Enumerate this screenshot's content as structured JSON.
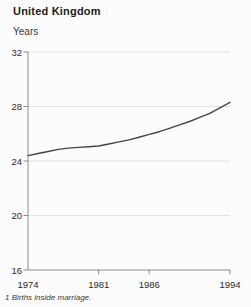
{
  "header": {
    "title": "United Kingdom",
    "ylabel": "Years"
  },
  "footnote": "1 Births inside marriage.",
  "chart_data": {
    "type": "line",
    "title": "United Kingdom",
    "xlabel": "",
    "ylabel": "Years",
    "xlim": [
      1974,
      1994
    ],
    "ylim": [
      16,
      32
    ],
    "grid": true,
    "legend": "none",
    "x": [
      1974,
      1975,
      1976,
      1977,
      1978,
      1979,
      1980,
      1981,
      1982,
      1983,
      1984,
      1985,
      1986,
      1987,
      1988,
      1989,
      1990,
      1991,
      1992,
      1993,
      1994
    ],
    "values": [
      24.4,
      24.55,
      24.7,
      24.85,
      24.95,
      25.0,
      25.05,
      25.1,
      25.25,
      25.4,
      25.55,
      25.75,
      25.95,
      26.15,
      26.4,
      26.65,
      26.9,
      27.2,
      27.5,
      27.9,
      28.3
    ],
    "xtick_labels": [
      "1974",
      "1981",
      "1986",
      "1994"
    ],
    "xtick_label_positions": [
      1974,
      1981,
      1986,
      1994
    ],
    "xtick_marks": [
      1981,
      1986,
      1994
    ],
    "yticks": [
      16,
      20,
      24,
      28,
      32
    ],
    "footnote": "1 Births inside marriage.",
    "colors": {
      "line": "#454545",
      "grid": "#dadada",
      "axis": "#8c8c8c",
      "tick": "#8c8c8c",
      "text": "#2a2a2a",
      "background": "#fcfcfc"
    }
  }
}
